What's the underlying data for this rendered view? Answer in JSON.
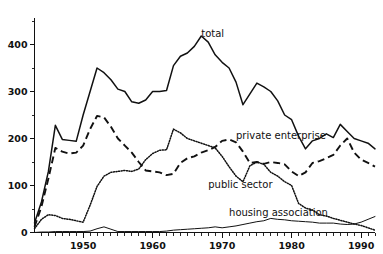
{
  "chart_data": {
    "type": "line",
    "title": "",
    "subtitle": "",
    "xlabel": "",
    "ylabel": "",
    "xlim": [
      1943,
      1992
    ],
    "ylim": [
      0,
      450
    ],
    "grid": false,
    "legend_position": "inline-annotations",
    "y_ticks": [
      0,
      100,
      200,
      300,
      400
    ],
    "y_tick_labels": [
      "0",
      "100",
      "200",
      "300",
      "400"
    ],
    "y_minor_ticks": [
      50,
      150,
      250,
      350,
      450
    ],
    "x_ticks": [
      1950,
      1960,
      1970,
      1980,
      1990
    ],
    "x_tick_labels": [
      "1950",
      "1960",
      "1970",
      "1980",
      "1990"
    ],
    "x_minor_tick_interval": 1,
    "annotations": [
      {
        "text": "total",
        "x": 1967,
        "y": 415
      },
      {
        "text": "private enterprise",
        "x": 1972,
        "y": 200
      },
      {
        "text": "public sector",
        "x": 1968,
        "y": 95
      },
      {
        "text": "housing association",
        "x": 1971,
        "y": 35
      }
    ],
    "x": [
      1943,
      1944,
      1945,
      1946,
      1947,
      1948,
      1949,
      1950,
      1951,
      1952,
      1953,
      1954,
      1955,
      1956,
      1957,
      1958,
      1959,
      1960,
      1961,
      1962,
      1963,
      1964,
      1965,
      1966,
      1967,
      1968,
      1969,
      1970,
      1971,
      1972,
      1973,
      1974,
      1975,
      1976,
      1977,
      1978,
      1979,
      1980,
      1981,
      1982,
      1983,
      1984,
      1985,
      1986,
      1987,
      1988,
      1989,
      1990,
      1991,
      1992
    ],
    "series": [
      {
        "name": "total",
        "style": "solid",
        "values": [
          20,
          65,
          130,
          228,
          198,
          196,
          194,
          250,
          300,
          350,
          340,
          325,
          305,
          300,
          278,
          275,
          282,
          300,
          300,
          302,
          355,
          375,
          382,
          396,
          418,
          405,
          378,
          362,
          350,
          320,
          272,
          295,
          318,
          310,
          300,
          280,
          250,
          240,
          205,
          178,
          195,
          200,
          210,
          202,
          230,
          215,
          200,
          195,
          190,
          178
        ]
      },
      {
        "name": "private enterprise",
        "style": "dashed",
        "values": [
          12,
          55,
          115,
          180,
          172,
          168,
          170,
          185,
          220,
          248,
          245,
          225,
          200,
          185,
          170,
          150,
          132,
          130,
          128,
          122,
          125,
          148,
          158,
          162,
          170,
          175,
          182,
          195,
          198,
          192,
          172,
          148,
          150,
          146,
          150,
          148,
          145,
          130,
          120,
          128,
          148,
          152,
          158,
          165,
          185,
          200,
          170,
          155,
          148,
          140
        ]
      },
      {
        "name": "public sector",
        "style": "dotted",
        "values": [
          8,
          28,
          38,
          36,
          30,
          28,
          25,
          22,
          58,
          98,
          120,
          128,
          130,
          132,
          130,
          135,
          155,
          168,
          175,
          176,
          220,
          212,
          200,
          195,
          190,
          185,
          180,
          162,
          140,
          120,
          108,
          142,
          150,
          145,
          128,
          120,
          108,
          100,
          62,
          52,
          48,
          38,
          35,
          30,
          26,
          22,
          18,
          15,
          10,
          5
        ]
      },
      {
        "name": "housing association",
        "style": "thin-solid",
        "values": [
          0,
          1,
          1,
          2,
          2,
          2,
          2,
          2,
          3,
          8,
          12,
          7,
          2,
          2,
          2,
          2,
          2,
          2,
          2,
          3,
          5,
          6,
          7,
          8,
          9,
          10,
          12,
          10,
          12,
          14,
          17,
          20,
          23,
          25,
          30,
          28,
          27,
          25,
          24,
          23,
          22,
          20,
          20,
          20,
          18,
          17,
          18,
          22,
          28,
          34
        ]
      }
    ]
  }
}
